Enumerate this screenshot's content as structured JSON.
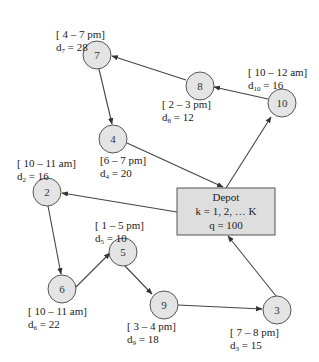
{
  "colors": {
    "node_fill": "#e4e4e4",
    "stroke": "#555555",
    "depot_fill": "#dedede",
    "edge": "#444444"
  },
  "depot": {
    "title": "Depot",
    "vehicles": "k = 1, 2, … K",
    "capacity": "q = 100"
  },
  "nodes": [
    {
      "id": "7",
      "window": "[ 4 – 7 pm]",
      "demand_sym": "d",
      "demand_idx": "7",
      "demand_val": " = 28"
    },
    {
      "id": "8",
      "window": "[ 2 – 3 pm]",
      "demand_sym": "d",
      "demand_idx": "8",
      "demand_val": " = 12"
    },
    {
      "id": "10",
      "window": "[ 10 – 12 am]",
      "demand_sym": "d",
      "demand_idx": "10",
      "demand_val": " = 16"
    },
    {
      "id": "4",
      "window": "[6 – 7 pm]",
      "demand_sym": "d",
      "demand_idx": "4",
      "demand_val": " = 20"
    },
    {
      "id": "2",
      "window": "[ 10 – 11 am]",
      "demand_sym": "d",
      "demand_idx": "2",
      "demand_val": " = 16"
    },
    {
      "id": "5",
      "window": "[ 1 – 5 pm]",
      "demand_sym": "d",
      "demand_idx": "5",
      "demand_val": " = 10"
    },
    {
      "id": "6",
      "window": "[ 10 – 11 am]",
      "demand_sym": "d",
      "demand_idx": "6",
      "demand_val": " = 22"
    },
    {
      "id": "9",
      "window": "[ 3 – 4 pm]",
      "demand_sym": "d",
      "demand_idx": "9",
      "demand_val": " = 18"
    },
    {
      "id": "3",
      "window": "[ 7 – 8 pm]",
      "demand_sym": "d",
      "demand_idx": "3",
      "demand_val": " = 15"
    }
  ],
  "edges": [
    {
      "from": "Depot",
      "to": "10"
    },
    {
      "from": "10",
      "to": "8"
    },
    {
      "from": "8",
      "to": "7"
    },
    {
      "from": "7",
      "to": "4"
    },
    {
      "from": "4",
      "to": "Depot"
    },
    {
      "from": "Depot",
      "to": "2"
    },
    {
      "from": "2",
      "to": "6"
    },
    {
      "from": "6",
      "to": "5"
    },
    {
      "from": "5",
      "to": "9"
    },
    {
      "from": "9",
      "to": "3"
    },
    {
      "from": "3",
      "to": "Depot"
    }
  ]
}
